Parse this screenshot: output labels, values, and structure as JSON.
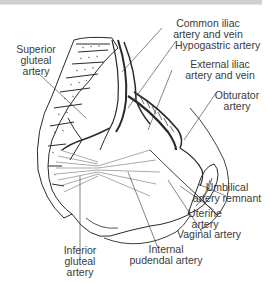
{
  "figure": {
    "background": "#ffffff",
    "ink_color": "#2a2a2a",
    "label_color": "#3a3a3a"
  },
  "labels": {
    "superior_gluteal": {
      "line1": "Superior",
      "line2": "gluteal",
      "line3": "artery"
    },
    "common_iliac": {
      "line1": "Common iliac",
      "line2": "artery and vein"
    },
    "hypogastric": {
      "line1": "Hypogastric artery"
    },
    "external_iliac": {
      "line1": "External iliac",
      "line2": "artery and vein"
    },
    "obturator": {
      "line1": "Obturator",
      "line2": "artery"
    },
    "umbilical_remnant": {
      "line1": "Umbilical",
      "line2": "artery remnant"
    },
    "uterine": {
      "line1": "Uterine",
      "line2": "artery"
    },
    "vaginal": {
      "line1": "Vaginal artery"
    },
    "internal_pudendal": {
      "line1": "Internal",
      "line2": "pudendal artery"
    },
    "inferior_gluteal": {
      "line1": "Inferior",
      "line2": "gluteal",
      "line3": "artery"
    }
  }
}
